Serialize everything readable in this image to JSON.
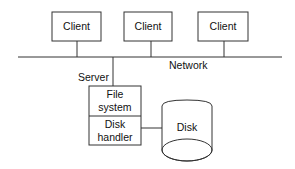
{
  "diagram": {
    "clients": [
      {
        "label": "Client"
      },
      {
        "label": "Client"
      },
      {
        "label": "Client"
      }
    ],
    "network_label": "Network",
    "server_label": "Server",
    "server_stack": {
      "top": {
        "line1": "File",
        "line2": "system"
      },
      "bottom": {
        "line1": "Disk",
        "line2": "handler"
      }
    },
    "disk_label": "Disk",
    "colors": {
      "line": "#333333",
      "text": "#111111",
      "background": "#ffffff"
    }
  }
}
